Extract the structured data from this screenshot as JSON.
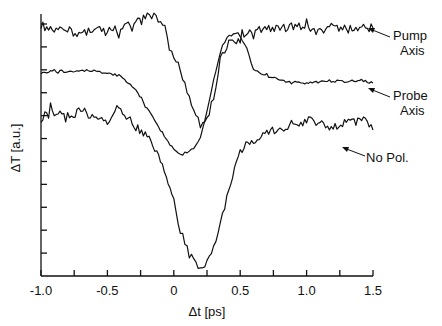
{
  "chart_data": {
    "type": "line",
    "title": "",
    "xlabel": "Δt [ps]",
    "ylabel": "ΔT [a.u.]",
    "xlim": [
      -1.0,
      1.5
    ],
    "x_ticks": [
      -1.0,
      -0.75,
      -0.5,
      -0.25,
      0,
      0.25,
      0.5,
      0.75,
      1.0,
      1.25,
      1.5
    ],
    "x_tick_labels": [
      "-1.0",
      "-0.5",
      "0",
      "0.5",
      "1.0",
      "1.5"
    ],
    "x_tick_label_values": [
      -1.0,
      -0.5,
      0,
      0.5,
      1.0,
      1.5
    ],
    "y_tick_count": 11,
    "y_tick_labels": [],
    "grid": false,
    "legend": "annotations with arrows at right",
    "series": [
      {
        "name": "Pump Axis",
        "label_lines": [
          "Pump",
          "Axis"
        ],
        "x": [
          -1.0,
          -0.9,
          -0.8,
          -0.7,
          -0.6,
          -0.5,
          -0.4,
          -0.3,
          -0.2,
          -0.15,
          -0.1,
          -0.05,
          0.0,
          0.05,
          0.1,
          0.15,
          0.2,
          0.25,
          0.3,
          0.35,
          0.4,
          0.5,
          0.6,
          0.7,
          0.8,
          0.9,
          1.0,
          1.1,
          1.2,
          1.3,
          1.4,
          1.5
        ],
        "y_px": [
          25,
          32,
          30,
          34,
          28,
          32,
          28,
          25,
          16,
          14,
          24,
          40,
          58,
          70,
          90,
          110,
          124,
          118,
          100,
          60,
          44,
          40,
          32,
          28,
          30,
          26,
          28,
          33,
          25,
          30,
          26,
          28
        ],
        "description": "noisy flat top, dip to minimum near t=0.18 ps, recovers by ~0.35 ps"
      },
      {
        "name": "Probe Axis",
        "label_lines": [
          "Probe",
          "Axis"
        ],
        "x": [
          -1.0,
          -0.9,
          -0.8,
          -0.7,
          -0.6,
          -0.5,
          -0.4,
          -0.3,
          -0.2,
          -0.1,
          0.0,
          0.05,
          0.1,
          0.15,
          0.2,
          0.25,
          0.3,
          0.35,
          0.4,
          0.45,
          0.5,
          0.55,
          0.6,
          0.7,
          0.8,
          0.9,
          1.0,
          1.1,
          1.2,
          1.3,
          1.4,
          1.5
        ],
        "y_px": [
          73,
          71,
          72,
          70,
          71,
          73,
          76,
          88,
          108,
          130,
          150,
          155,
          152,
          148,
          138,
          112,
          80,
          52,
          38,
          33,
          36,
          48,
          70,
          76,
          80,
          82,
          83,
          82,
          81,
          82,
          80,
          83
        ],
        "description": "smooth flat, dip to minimum near t=0.05 ps, overshoot peak near t=0.45 ps, settles slightly below initial level"
      },
      {
        "name": "No Pol.",
        "label_lines": [
          "No Pol."
        ],
        "x": [
          -1.0,
          -0.9,
          -0.8,
          -0.7,
          -0.6,
          -0.5,
          -0.4,
          -0.3,
          -0.2,
          -0.1,
          0.0,
          0.05,
          0.1,
          0.15,
          0.2,
          0.25,
          0.3,
          0.35,
          0.4,
          0.5,
          0.6,
          0.7,
          0.8,
          0.9,
          1.0,
          1.1,
          1.2,
          1.3,
          1.4,
          1.5
        ],
        "y_px": [
          118,
          112,
          120,
          108,
          118,
          122,
          110,
          125,
          135,
          160,
          200,
          230,
          250,
          262,
          268,
          262,
          248,
          225,
          195,
          150,
          140,
          132,
          128,
          125,
          122,
          120,
          128,
          122,
          118,
          130
        ],
        "description": "noisy baseline, deep dip to minimum near t=0.2 ps, recovers to near baseline by ~0.6 ps"
      }
    ]
  },
  "axes": {
    "x_title": "Δt [ps]",
    "y_title": "ΔT [a.u.]"
  },
  "annotations": {
    "pump_line1": "Pump",
    "pump_line2": "Axis",
    "probe_line1": "Probe",
    "probe_line2": "Axis",
    "nopol_line1": "No Pol."
  }
}
